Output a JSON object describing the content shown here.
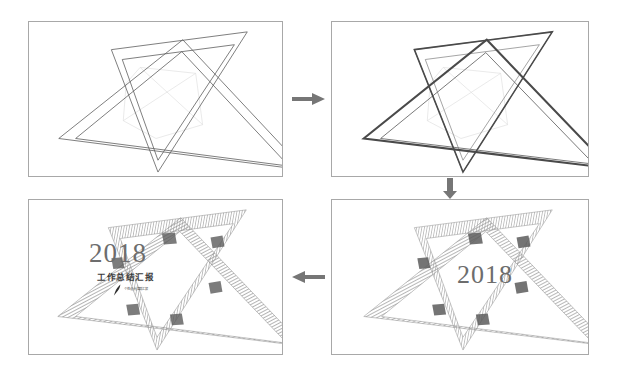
{
  "canvas": {
    "width": 617,
    "height": 375,
    "background": "#ffffff",
    "description": "Four-step construction progression of a hexagram (Star of David) graphic arranged in a 2x2 grid with connecting arrows"
  },
  "theme": {
    "panel_border": "#a8a8a8",
    "line_light": "#7a7a7a",
    "line_dark": "#3a3a3a",
    "guide_line": "#d8d8d8",
    "hatch_gray": "#9a9a9a",
    "hatch_dark": "#5a5a5a",
    "year_color": "#6d6d6d",
    "cn_color": "#3c3c3c",
    "arrow_color": "#767676"
  },
  "panels": [
    {
      "id": "step-1",
      "name": "panel-step-1",
      "order": 1,
      "stage_label": "outline-triangles",
      "x": 28,
      "y": 21,
      "w": 255,
      "h": 156,
      "style": "thin-outline",
      "has_year": false,
      "has_subtitle": false
    },
    {
      "id": "step-2",
      "name": "panel-step-2",
      "order": 2,
      "stage_label": "thick-stroke-triangles",
      "x": 331,
      "y": 21,
      "w": 258,
      "h": 156,
      "style": "bold-outline",
      "has_year": false,
      "has_subtitle": false
    },
    {
      "id": "step-3",
      "name": "panel-step-3",
      "order": 3,
      "stage_label": "hatched-bands-with-year",
      "x": 331,
      "y": 199,
      "w": 258,
      "h": 156,
      "style": "hatched",
      "has_year": true,
      "has_subtitle": false
    },
    {
      "id": "step-4",
      "name": "panel-step-4",
      "order": 4,
      "stage_label": "final-titled-artwork",
      "x": 28,
      "y": 199,
      "w": 255,
      "h": 156,
      "style": "hatched",
      "has_year": true,
      "has_subtitle": true
    }
  ],
  "arrows": [
    {
      "id": "arrow-1-to-2",
      "name": "arrow-right-top",
      "direction": "right",
      "x": 292,
      "y": 90,
      "length": 32
    },
    {
      "id": "arrow-2-to-3",
      "name": "arrow-down-right",
      "direction": "down",
      "x": 441,
      "y": 178,
      "length": 20
    },
    {
      "id": "arrow-3-to-4",
      "name": "arrow-left-bottom",
      "direction": "left",
      "x": 292,
      "y": 268,
      "length": 32
    }
  ],
  "content": {
    "year": "2018",
    "subtitle": "工作总结汇报",
    "logo_text": "个性设计|高端汇报",
    "logo_icon": "feather-pen-icon"
  },
  "panel3_text": {
    "year": "2018",
    "x": 125,
    "y": 60,
    "font_size": 26
  },
  "panel4_text": {
    "year": "2018",
    "year_x": 60,
    "year_y": 38,
    "year_font_size": 27,
    "subtitle": "工作总结汇报",
    "subtitle_x": 68,
    "subtitle_y": 70,
    "subtitle_font_size": 8.5,
    "logo_x": 84,
    "logo_y": 84
  },
  "geometry": {
    "note": "Each panel contains two overlapping equilateral-ish triangles (one point-up rotated ~12deg, one point-down rotated ~12deg) forming a hexagram. Each triangle is rendered as a band (outer + inner outline).",
    "triangle_up_outer": "155,18 278,150 40,123",
    "triangle_up_inner": "155,33 262,147 55,122",
    "triangle_down_outer": "105,22 228,20 140,152",
    "triangle_down_inner": "114,33 214,31 140,136"
  }
}
